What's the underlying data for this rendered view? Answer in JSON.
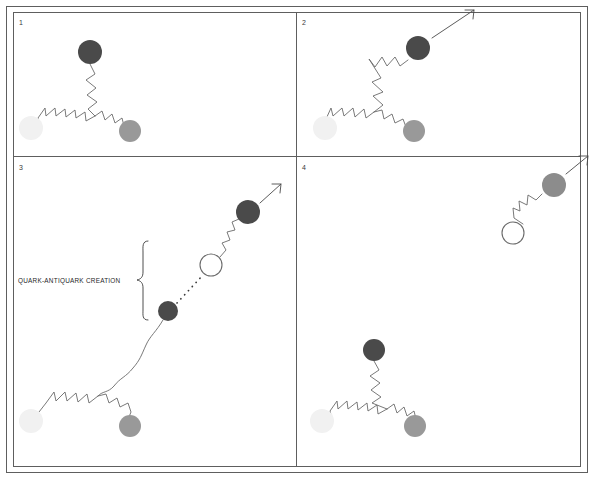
{
  "figure": {
    "panel_count": 4,
    "background_color": "#ffffff",
    "border_color": "#5e5e5e"
  },
  "labels": {
    "panel_1_number": "1",
    "panel_2_number": "2",
    "panel_3_number": "3",
    "panel_4_number": "4",
    "creation_caption": "QUARK-ANTIQUARK CREATION"
  },
  "colors": {
    "quark_dark": "#4a4a4a",
    "quark_medium": "#999999",
    "quark_light": "#f1f1f1",
    "quark_gray": "#8c8c8c",
    "antiquark_fill": "#ffffff",
    "antiquark_stroke": "#6a6a6a",
    "gluon_stroke": "#6a6a6a",
    "arrow_stroke": "#4a4a4a",
    "text": "#1f1f1f"
  },
  "panels": [
    {
      "id": "panel-1",
      "number": "1",
      "description": "Baryon at rest: three quarks joined by gluon strings at a central vertex",
      "particles": [
        {
          "name": "top-quark",
          "shade": "dark",
          "x": 90,
          "y": 52,
          "r": 12
        },
        {
          "name": "left-quark",
          "shade": "light",
          "x": 31,
          "y": 128,
          "r": 12
        },
        {
          "name": "right-quark",
          "shade": "medium",
          "x": 130,
          "y": 131,
          "r": 11
        }
      ],
      "has_arrow": false
    },
    {
      "id": "panel-2",
      "number": "2",
      "description": "Top quark moves away up-right, stretching its gluon string",
      "particles": [
        {
          "name": "moving-quark",
          "shade": "dark",
          "x": 418,
          "y": 48,
          "r": 12
        },
        {
          "name": "left-quark",
          "shade": "light",
          "x": 325,
          "y": 128,
          "r": 12
        },
        {
          "name": "right-quark",
          "shade": "medium",
          "x": 414,
          "y": 131,
          "r": 11
        }
      ],
      "has_arrow": true,
      "arrow": {
        "x1": 432,
        "y1": 38,
        "x2": 474,
        "y2": 10
      }
    },
    {
      "id": "panel-3",
      "number": "3",
      "description": "String breaks; a new quark-antiquark pair is created from the stored energy",
      "particles": [
        {
          "name": "escaping-quark",
          "shade": "dark",
          "x": 248,
          "y": 212,
          "r": 12
        },
        {
          "name": "new-antiquark",
          "shade": "hollow",
          "x": 211,
          "y": 265,
          "r": 11
        },
        {
          "name": "new-quark",
          "shade": "dark",
          "x": 168,
          "y": 311,
          "r": 10
        },
        {
          "name": "left-quark",
          "shade": "light",
          "x": 31,
          "y": 421,
          "r": 12
        },
        {
          "name": "right-quark",
          "shade": "medium",
          "x": 130,
          "y": 426,
          "r": 11
        }
      ],
      "has_arrow": true,
      "arrow": {
        "x1": 262,
        "y1": 202,
        "x2": 280,
        "y2": 185
      },
      "caption": "QUARK-ANTIQUARK CREATION",
      "caption_x": 18,
      "caption_y": 280
    },
    {
      "id": "panel-4",
      "number": "4",
      "description": "A meson flies off while the baryon re-forms with three quarks",
      "particles": [
        {
          "name": "meson-quark",
          "shade": "gray",
          "x": 554,
          "y": 185,
          "r": 12
        },
        {
          "name": "meson-antiquark",
          "shade": "hollow",
          "x": 513,
          "y": 233,
          "r": 11
        },
        {
          "name": "top-quark",
          "shade": "dark",
          "x": 374,
          "y": 350,
          "r": 11
        },
        {
          "name": "left-quark",
          "shade": "light",
          "x": 322,
          "y": 421,
          "r": 12
        },
        {
          "name": "right-quark",
          "shade": "medium",
          "x": 415,
          "y": 426,
          "r": 11
        }
      ],
      "has_arrow": true,
      "arrow": {
        "x1": 566,
        "y1": 174,
        "x2": 588,
        "y2": 157
      }
    }
  ]
}
